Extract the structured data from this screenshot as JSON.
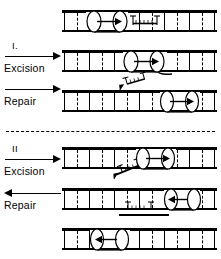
{
  "figure": {
    "background_color": "#ffffff",
    "ink_color": "#000000"
  },
  "divider": {
    "name": "section-divider",
    "style": "dashed"
  },
  "sections": [
    {
      "id": "I",
      "roman": "I.",
      "steps": [
        {
          "label": "Excision",
          "arrow_direction": "right"
        },
        {
          "label": "Repair",
          "arrow_direction": "right"
        }
      ],
      "rows": [
        {
          "stage": "before",
          "enzyme": {
            "label": "enzyme-cylinder",
            "arrow_direction": "right"
          },
          "lesion": {
            "label": "T—T",
            "left_base": "T",
            "right_base": "T",
            "bond": "dimer"
          },
          "fragment": null
        },
        {
          "stage": "after-excision",
          "enzyme": {
            "label": "enzyme-cylinder",
            "arrow_direction": "right"
          },
          "lesion": null,
          "fragment": {
            "label": "T—T",
            "position": "below-right",
            "orientation": "tilted"
          }
        },
        {
          "stage": "after-repair",
          "enzyme": {
            "label": "enzyme-cylinder",
            "arrow_direction": "right"
          },
          "lesion": null,
          "fragment": null
        }
      ]
    },
    {
      "id": "II",
      "roman": "II",
      "steps": [
        {
          "label": "Excision",
          "arrow_direction": "right"
        },
        {
          "label": "Repair",
          "arrow_direction": "left"
        }
      ],
      "rows": [
        {
          "stage": "before",
          "enzyme": {
            "label": "enzyme-cylinder",
            "arrow_direction": "right"
          },
          "lesion": null,
          "fragment": {
            "label": "T—T",
            "position": "below-left",
            "orientation": "tilted"
          }
        },
        {
          "stage": "after-excision",
          "enzyme": {
            "label": "enzyme-cylinder",
            "arrow_direction": "left"
          },
          "lesion": null,
          "fragment": {
            "label": "T—T",
            "position": "below-center",
            "orientation": "horizontal"
          }
        },
        {
          "stage": "after-repair",
          "enzyme": {
            "label": "enzyme-cylinder",
            "arrow_direction": "left"
          },
          "lesion": null,
          "fragment": null
        }
      ]
    }
  ],
  "glyphs": {
    "thymine_letter": "T",
    "dimer_bond": "hatched",
    "duplex_rung_count": 13
  }
}
